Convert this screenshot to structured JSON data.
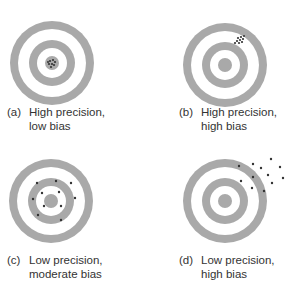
{
  "colors": {
    "ring": "#a9a9a9",
    "background": "#ffffff",
    "dot": "#333333",
    "text": "#333333"
  },
  "panels": [
    {
      "id": "a",
      "label": "(a)",
      "line1": "High precision,",
      "line2": "low bias"
    },
    {
      "id": "b",
      "label": "(b)",
      "line1": "High precision,",
      "line2": "high bias"
    },
    {
      "id": "c",
      "label": "(c)",
      "line1": "Low precision,",
      "line2": "moderate bias"
    },
    {
      "id": "d",
      "label": "(d)",
      "line1": "Low precision,",
      "line2": "high bias"
    }
  ]
}
